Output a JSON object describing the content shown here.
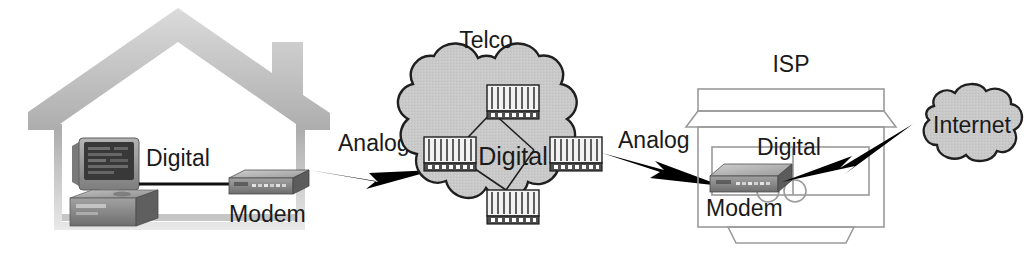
{
  "diagram": {
    "background_color": "#ffffff",
    "cloud_fill_color": "#c9c9c9",
    "cloud_stroke_color": "#1f1f1f",
    "house_outline_color": "#b6b6b6",
    "isp_outline_color": "#8e8e8e",
    "line_color": "#111111",
    "bolt_color": "#000000",
    "device_body_color": "#8d8d8d",
    "device_top_color": "#b9b9b9",
    "device_dark_color": "#4a4a4a",
    "labels": {
      "home_digital": "Digital",
      "home_modem": "Modem",
      "analog_left": "Analog",
      "telco": "Telco",
      "telco_digital": "Digital",
      "analog_right": "Analog",
      "isp": "ISP",
      "isp_digital": "Digital",
      "isp_modem": "Modem",
      "internet": "Internet"
    },
    "nodes": [
      {
        "id": "home",
        "kind": "house-outline",
        "label": ""
      },
      {
        "id": "home-computer",
        "kind": "desktop-computer",
        "label": ""
      },
      {
        "id": "home-modem",
        "kind": "modem-device",
        "label": "Modem"
      },
      {
        "id": "telco-cloud",
        "kind": "cloud",
        "label": "Telco"
      },
      {
        "id": "telco-switch-top",
        "kind": "switch-device",
        "label": ""
      },
      {
        "id": "telco-switch-left",
        "kind": "switch-device",
        "label": ""
      },
      {
        "id": "telco-switch-right",
        "kind": "switch-device",
        "label": ""
      },
      {
        "id": "telco-switch-bottom",
        "kind": "switch-device",
        "label": ""
      },
      {
        "id": "isp-building",
        "kind": "building-outline",
        "label": "ISP"
      },
      {
        "id": "isp-modem",
        "kind": "modem-device",
        "label": "Modem"
      },
      {
        "id": "internet-cloud",
        "kind": "cloud",
        "label": "Internet"
      }
    ],
    "links": [
      {
        "from": "home-computer",
        "to": "home-modem",
        "label": "Digital",
        "style": "solid-line"
      },
      {
        "from": "home-modem",
        "to": "telco-cloud",
        "label": "Analog",
        "style": "lightning-bolt"
      },
      {
        "from": "telco-cloud",
        "to": "isp-modem",
        "label": "Analog",
        "style": "lightning-bolt"
      },
      {
        "from": "isp-modem",
        "to": "internet-cloud",
        "label": "Digital",
        "style": "lightning-bolt"
      },
      {
        "from": "telco-switch-left",
        "to": "telco-switch-top",
        "label": "",
        "style": "solid-line"
      },
      {
        "from": "telco-switch-top",
        "to": "telco-switch-right",
        "label": "",
        "style": "solid-line"
      },
      {
        "from": "telco-switch-right",
        "to": "telco-switch-bottom",
        "label": "",
        "style": "solid-line"
      },
      {
        "from": "telco-switch-bottom",
        "to": "telco-switch-left",
        "label": "",
        "style": "solid-line"
      }
    ]
  }
}
